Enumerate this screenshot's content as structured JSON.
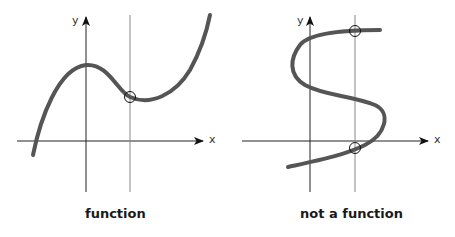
{
  "panels": [
    {
      "caption": "function",
      "x_label": "x",
      "y_label": "y",
      "intersections": 1
    },
    {
      "caption": "not a function",
      "x_label": "x",
      "y_label": "y",
      "intersections": 2
    }
  ],
  "colors": {
    "curve": "#555555",
    "axes": "#222222",
    "test_line": "#888888"
  }
}
